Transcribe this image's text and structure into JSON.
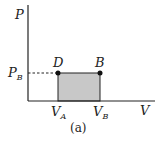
{
  "diagram": {
    "axes": {
      "y_label": "P",
      "x_label": "V"
    },
    "points": [
      {
        "name": "D",
        "x_label": "V",
        "x_sub": "A",
        "y_label": "P",
        "y_sub": "B"
      },
      {
        "name": "B",
        "x_label": "V",
        "x_sub": "B",
        "y_label": "P",
        "y_sub": "B"
      }
    ],
    "tick_labels": {
      "p_b": {
        "main": "P",
        "sub": "B"
      },
      "v_a": {
        "main": "V",
        "sub": "A"
      },
      "v_b": {
        "main": "V",
        "sub": "B"
      }
    },
    "caption": "(a)",
    "colors": {
      "shade": "#c8c8c8",
      "line": "#222222"
    }
  }
}
